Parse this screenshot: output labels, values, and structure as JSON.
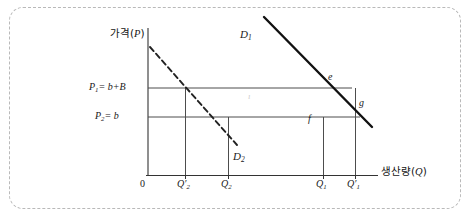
{
  "figure": {
    "type": "economics-demand-diagram",
    "axes": {
      "y_label": "가격(P)",
      "y_label_text": "가격",
      "y_label_var": "P",
      "x_label": "생산량(Q)",
      "x_label_text": "생산량",
      "x_label_var": "Q",
      "origin": "0"
    },
    "price_levels": [
      {
        "id": "p1",
        "label": "P₁= b+B",
        "base": "P",
        "sub": "1",
        "equation": "= b+B",
        "y_px": 88
      },
      {
        "id": "p2",
        "label": "P₂= b",
        "base": "P",
        "sub": "2",
        "equation": "= b",
        "y_px": 117
      }
    ],
    "quantity_ticks": [
      {
        "id": "q2prime",
        "base": "Q",
        "prime": "′",
        "sub": "2",
        "label": "Q′₂",
        "x_px": 185
      },
      {
        "id": "q2",
        "base": "Q",
        "prime": "",
        "sub": "2",
        "label": "Q₂",
        "x_px": 228
      },
      {
        "id": "q1",
        "base": "Q",
        "prime": "",
        "sub": "1",
        "label": "Q₁",
        "x_px": 323
      },
      {
        "id": "q1prime",
        "base": "Q",
        "prime": "′",
        "sub": "1",
        "label": "Q′₁",
        "x_px": 355
      }
    ],
    "curves": [
      {
        "id": "d1",
        "base": "D",
        "sub": "1",
        "label": "D₁",
        "style": "solid",
        "note": "steeper solid demand curve, upper right"
      },
      {
        "id": "d2",
        "base": "D",
        "sub": "2",
        "label": "D₂",
        "style": "dashed",
        "note": "dashed demand curve, lower left"
      }
    ],
    "points": [
      {
        "id": "e",
        "label": "e",
        "x_px": 330,
        "y_px": 78
      },
      {
        "id": "f",
        "label": "f",
        "x_px": 311,
        "y_px": 119
      },
      {
        "id": "g",
        "label": "g",
        "x_px": 361,
        "y_px": 104
      }
    ],
    "colors": {
      "line": "#1a1a1a",
      "grid_line": "#555555",
      "frame": "#b9b9b9",
      "background": "#ffffff",
      "text": "#1a1a1a"
    }
  }
}
